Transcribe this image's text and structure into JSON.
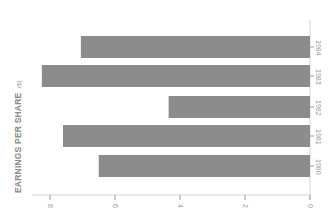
{
  "chart_data": {
    "type": "bar",
    "orientation": "horizontal (image rotated 90°)",
    "title": "EARNINGS PER SHARE ($)",
    "title_main": "EARNINGS PER SHARE",
    "title_unit": "($)",
    "xlabel": "",
    "ylabel": "Earnings per share ($)",
    "categories": [
      "1980",
      "1981",
      "1982",
      "1983",
      "1984"
    ],
    "values": [
      6.5,
      7.6,
      4.35,
      8.25,
      7.05
    ],
    "ylim": [
      0,
      8
    ],
    "ticks": [
      "8",
      "6",
      "4",
      "2",
      "0"
    ],
    "tick_values": [
      8,
      6,
      4,
      2,
      0
    ],
    "grid": false,
    "legend": null,
    "bar_color": "#8c8c8c"
  }
}
